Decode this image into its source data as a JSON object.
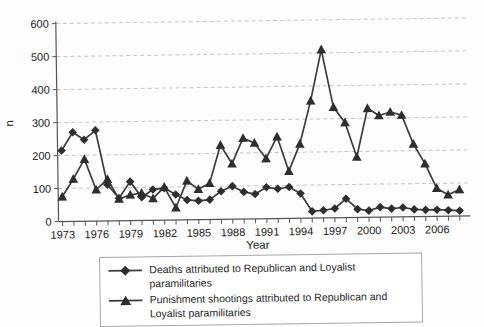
{
  "figure": {
    "background": "#fdfdfd",
    "line_color": "#3d3d3d",
    "marker_color": "#2e2e2e",
    "grid_color": "#c4c4c4",
    "axis_color": "#555555",
    "text_color": "#1f1f1f",
    "legend_border_color": "#a8a8a8"
  },
  "chart_data": {
    "type": "line",
    "title": "",
    "xlabel": "Year",
    "ylabel": "n",
    "ylim": [
      0,
      600
    ],
    "yticks": [
      0,
      100,
      200,
      300,
      400,
      500,
      600
    ],
    "xticks_labeled": [
      1973,
      1976,
      1979,
      1982,
      1985,
      1988,
      1991,
      1994,
      1997,
      2000,
      2003,
      2006
    ],
    "grid": "horizontal dashed",
    "legend_position": "bottom",
    "x": [
      1973,
      1974,
      1975,
      1976,
      1977,
      1978,
      1979,
      1980,
      1981,
      1982,
      1983,
      1984,
      1985,
      1986,
      1987,
      1988,
      1989,
      1990,
      1991,
      1992,
      1993,
      1994,
      1995,
      1996,
      1997,
      1998,
      1999,
      2000,
      2001,
      2002,
      2003,
      2004,
      2005,
      2006,
      2007,
      2008
    ],
    "series": [
      {
        "name": "Deaths attributed to Republican and Loyalist paramilitaries",
        "marker": "diamond",
        "values": [
          215,
          270,
          247,
          275,
          110,
          68,
          118,
          70,
          93,
          97,
          77,
          60,
          57,
          60,
          85,
          100,
          82,
          75,
          95,
          90,
          95,
          75,
          20,
          23,
          28,
          57,
          25,
          20,
          30,
          25,
          28,
          22,
          20,
          20,
          18,
          16
        ]
      },
      {
        "name": "Punishment shootings attributed to Republican and Loyalist paramilitaries",
        "marker": "triangle",
        "values": [
          75,
          128,
          188,
          95,
          126,
          66,
          78,
          83,
          66,
          100,
          37,
          118,
          92,
          110,
          225,
          168,
          245,
          230,
          182,
          248,
          143,
          225,
          355,
          510,
          335,
          288,
          183,
          330,
          308,
          318,
          308,
          220,
          160,
          85,
          65,
          80
        ]
      }
    ]
  }
}
